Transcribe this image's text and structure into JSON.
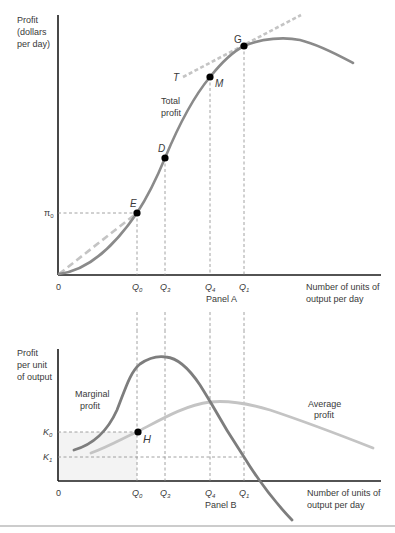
{
  "panel_a": {
    "title": "Panel A",
    "y_axis_label": [
      "Profit",
      "(dollars",
      "per day)"
    ],
    "x_axis_label": [
      "Number of units of",
      "output per day"
    ],
    "origin": "0",
    "pi_label": "π",
    "pi_sub": "0",
    "curve_label": [
      "Total",
      "profit"
    ],
    "tangent_label": "T",
    "points": {
      "E": "E",
      "D": "D",
      "M": "M",
      "G": "G"
    },
    "x_ticks": [
      {
        "main": "Q",
        "sub": "0"
      },
      {
        "main": "Q",
        "sub": "3"
      },
      {
        "main": "Q",
        "sub": "4"
      },
      {
        "main": "Q",
        "sub": "1"
      }
    ]
  },
  "panel_b": {
    "title": "Panel B",
    "y_axis_label": [
      "Profit",
      "per unit",
      "of output"
    ],
    "x_axis_label": [
      "Number of units of",
      "output per day"
    ],
    "origin": "0",
    "k0_label": "K",
    "k0_sub": "0",
    "k1_label": "K",
    "k1_sub": "1",
    "marginal_label": [
      "Marginal",
      "profit"
    ],
    "average_label": [
      "Average",
      "profit"
    ],
    "point_H": "H",
    "x_ticks": [
      {
        "main": "Q",
        "sub": "0"
      },
      {
        "main": "Q",
        "sub": "3"
      },
      {
        "main": "Q",
        "sub": "4"
      },
      {
        "main": "Q",
        "sub": "1"
      }
    ]
  },
  "colors": {
    "axis": "#1a1a1a",
    "total_profit": "#8a8a8a",
    "marginal_profit": "#7d7d7d",
    "average_profit": "#c4c4c4",
    "tangent": "#bdbdbd",
    "guide": "#8a8a8a",
    "shade": "#f3f3f3",
    "point": "#000000"
  }
}
